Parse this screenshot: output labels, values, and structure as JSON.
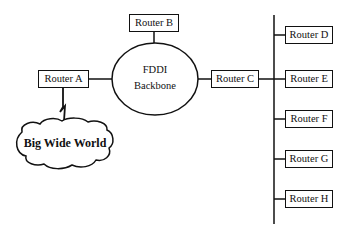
{
  "diagram": {
    "backbone": {
      "line1": "FDDI",
      "line2": "Backbone"
    },
    "cloud": {
      "label": "Big Wide World"
    },
    "routers": {
      "a": "Router A",
      "b": "Router B",
      "c": "Router C",
      "d": "Router D",
      "e": "Router E",
      "f": "Router F",
      "g": "Router G",
      "h": "Router H"
    },
    "colors": {
      "stroke": "#111111",
      "background": "#ffffff"
    }
  }
}
